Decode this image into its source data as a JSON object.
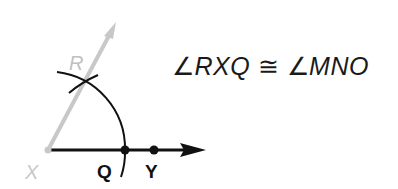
{
  "diagram": {
    "points": {
      "X": {
        "label": "X",
        "x": 48,
        "y": 150,
        "color": "#c8c8c8"
      },
      "Q": {
        "label": "Q",
        "x": 125,
        "y": 150,
        "color": "#111111"
      },
      "Y": {
        "label": "Y",
        "x": 154,
        "y": 150,
        "color": "#111111"
      },
      "R": {
        "label": "R",
        "x": 85,
        "y": 82,
        "color": "#c0c0c0"
      }
    },
    "rays": [
      {
        "name": "XY",
        "from": "X",
        "to": [
          205,
          150
        ],
        "color": "#111111"
      },
      {
        "name": "XR",
        "from": "X",
        "to": [
          116,
          22
        ],
        "color": "#c8c8c8"
      }
    ],
    "arcs": [
      {
        "name": "main-arc",
        "center": "X",
        "radius": 77
      },
      {
        "name": "cross-arc",
        "center": "Q",
        "through": "R"
      }
    ],
    "colors": {
      "ink": "#111111",
      "light": "#c8c8c8"
    }
  },
  "statement": {
    "angle_symbol": "∠",
    "left_angle": "RXQ",
    "congruent_symbol": "≅",
    "right_angle": "MNO"
  }
}
